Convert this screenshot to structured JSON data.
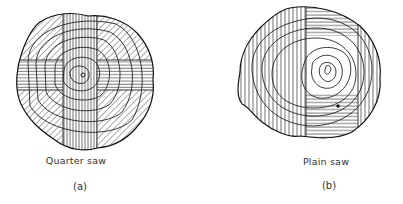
{
  "figures": [
    {
      "id": "a",
      "caption": "Quarter saw",
      "sublabel": "(a)",
      "description": "Log cross-section with vertical and horizontal central planks and diagonally hatched quarter sections"
    },
    {
      "id": "b",
      "caption": "Plain saw",
      "sublabel": "(b)",
      "description": "Log cross-section sawn into parallel boards around a central boxed heart"
    }
  ],
  "colors": {
    "ink": "#222222",
    "background": "#ffffff"
  }
}
